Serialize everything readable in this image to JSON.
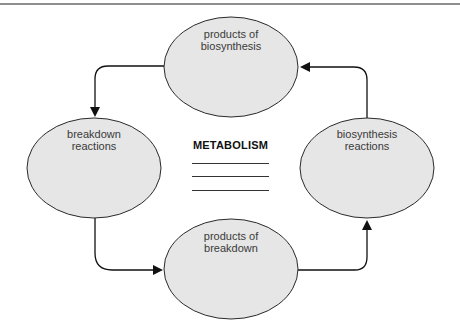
{
  "diagram": {
    "title": "METABOLISM",
    "blank_lines": 3,
    "nodes": [
      {
        "id": "products_of_biosynthesis",
        "label_line1": "products of",
        "label_line2": "biosynthesis"
      },
      {
        "id": "breakdown_reactions",
        "label_line1": "breakdown",
        "label_line2": "reactions"
      },
      {
        "id": "biosynthesis_reactions",
        "label_line1": "biosynthesis",
        "label_line2": "reactions"
      },
      {
        "id": "products_of_breakdown",
        "label_line1": "products of",
        "label_line2": "breakdown"
      }
    ],
    "edges": [
      {
        "from": "products_of_biosynthesis",
        "to": "breakdown_reactions"
      },
      {
        "from": "breakdown_reactions",
        "to": "products_of_breakdown"
      },
      {
        "from": "products_of_breakdown",
        "to": "biosynthesis_reactions"
      },
      {
        "from": "biosynthesis_reactions",
        "to": "products_of_biosynthesis"
      }
    ],
    "colors": {
      "node_fill": "#e6e6e6",
      "node_stroke": "#2a2a2a",
      "arrow": "#111111",
      "rule": "#8d8d8d"
    }
  }
}
